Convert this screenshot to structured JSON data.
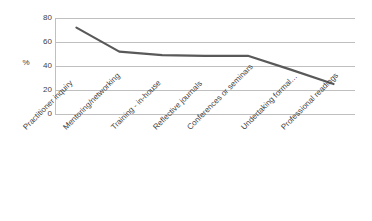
{
  "chart_data": {
    "type": "line",
    "title": "",
    "xlabel": "",
    "ylabel": "%",
    "categories": [
      "Practitioner inquiry",
      "Mentoring/networking",
      "Training - in-house",
      "Reflective journals",
      "Conferences or seminars",
      "Undertaking formal…",
      "Professional readings"
    ],
    "values": [
      72,
      52,
      49,
      48.5,
      48.5,
      37,
      25
    ],
    "series": [
      {
        "name": "%",
        "values": [
          72,
          52,
          49,
          48.5,
          48.5,
          37,
          25
        ]
      }
    ],
    "ylim": [
      0,
      80
    ],
    "ytick_labels": [
      "80",
      "60",
      "40",
      "20",
      "0"
    ],
    "ytick_values": [
      80,
      60,
      40,
      20,
      0
    ],
    "grid": true,
    "legend": "none",
    "line_color": "#595959",
    "grid_color": "#bfbfbf",
    "background_color": "#ffffff",
    "label_rotation_deg": -45
  }
}
